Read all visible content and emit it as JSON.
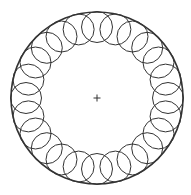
{
  "diagram": {
    "type": "circle-ring-pattern",
    "background": "#ffffff",
    "stroke_color": "#333333",
    "center": {
      "x": 97,
      "y": 98
    },
    "outer_circle": {
      "r": 86,
      "stroke_width": 1.6
    },
    "ring": {
      "count": 24,
      "orbit_radius": 71,
      "circle_radius": 15.5,
      "stroke_width": 1.0
    },
    "center_mark": {
      "symbol": "plus",
      "size": 3.5,
      "stroke_width": 1.0
    }
  }
}
